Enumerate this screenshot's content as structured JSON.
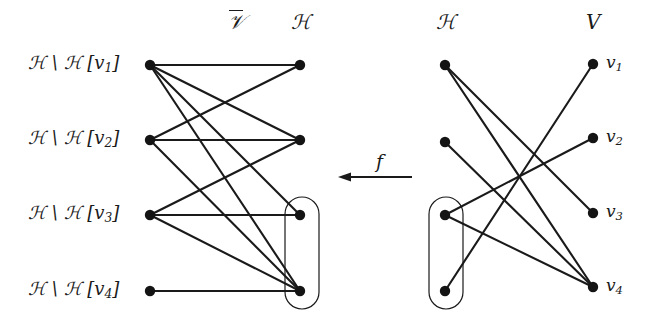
{
  "figure": {
    "background_color": "#ffffff",
    "ink_color": "#1a1a1a",
    "width": 662,
    "height": 325
  },
  "left_graph": {
    "column_headers": {
      "left": "𝒱",
      "left_plain": "V-bar",
      "right": "ℋ"
    },
    "left_nodes": [
      {
        "id": "L1",
        "label_prefix": "ℋ \\ ℋ [v",
        "label_sub": "1",
        "label_suffix": "]",
        "x": 150,
        "y": 65
      },
      {
        "id": "L2",
        "label_prefix": "ℋ \\ ℋ [v",
        "label_sub": "2",
        "label_suffix": "]",
        "x": 150,
        "y": 140
      },
      {
        "id": "L3",
        "label_prefix": "ℋ \\ ℋ [v",
        "label_sub": "3",
        "label_suffix": "]",
        "x": 150,
        "y": 215
      },
      {
        "id": "L4",
        "label_prefix": "ℋ \\ ℋ [v",
        "label_sub": "4",
        "label_suffix": "]",
        "x": 150,
        "y": 291
      }
    ],
    "right_nodes": [
      {
        "id": "R1",
        "x": 300,
        "y": 65
      },
      {
        "id": "R2",
        "x": 300,
        "y": 140
      },
      {
        "id": "R3",
        "x": 300,
        "y": 215
      },
      {
        "id": "R4",
        "x": 300,
        "y": 291
      }
    ],
    "edges": [
      {
        "from": "L1",
        "to": "R1"
      },
      {
        "from": "L1",
        "to": "R2"
      },
      {
        "from": "L1",
        "to": "R3"
      },
      {
        "from": "L1",
        "to": "R4"
      },
      {
        "from": "L2",
        "to": "R1"
      },
      {
        "from": "L2",
        "to": "R2"
      },
      {
        "from": "L2",
        "to": "R4"
      },
      {
        "from": "L3",
        "to": "R2"
      },
      {
        "from": "L3",
        "to": "R3"
      },
      {
        "from": "L3",
        "to": "R4"
      },
      {
        "from": "L4",
        "to": "R4"
      }
    ],
    "grouping_oval": {
      "members": [
        "R3",
        "R4"
      ],
      "x": 285,
      "y": 197,
      "width": 34,
      "height": 112,
      "radius": 17
    }
  },
  "mapping_arrow": {
    "label": "f",
    "direction": "right-to-left",
    "x_start": 412,
    "x_end": 338,
    "y": 177,
    "label_x": 376,
    "label_y": 152
  },
  "right_graph": {
    "column_headers": {
      "left": "ℋ",
      "right": "V"
    },
    "left_nodes": [
      {
        "id": "H1",
        "x": 445,
        "y": 65
      },
      {
        "id": "H2",
        "x": 445,
        "y": 142
      },
      {
        "id": "H3",
        "x": 445,
        "y": 215
      },
      {
        "id": "H4",
        "x": 445,
        "y": 291
      }
    ],
    "right_nodes": [
      {
        "id": "V1",
        "label_prefix": "v",
        "label_sub": "1",
        "x": 593,
        "y": 64
      },
      {
        "id": "V2",
        "label_prefix": "v",
        "label_sub": "2",
        "x": 593,
        "y": 138
      },
      {
        "id": "V3",
        "label_prefix": "v",
        "label_sub": "3",
        "x": 593,
        "y": 213
      },
      {
        "id": "V4",
        "label_prefix": "v",
        "label_sub": "4",
        "x": 593,
        "y": 287
      }
    ],
    "edges": [
      {
        "from": "H1",
        "to": "V3"
      },
      {
        "from": "H1",
        "to": "V4"
      },
      {
        "from": "H2",
        "to": "V4"
      },
      {
        "from": "H3",
        "to": "V2"
      },
      {
        "from": "H3",
        "to": "V4"
      },
      {
        "from": "H4",
        "to": "V1"
      }
    ],
    "grouping_oval": {
      "members": [
        "H3",
        "H4"
      ],
      "x": 429,
      "y": 197,
      "width": 34,
      "height": 112,
      "radius": 17
    }
  },
  "headers": {
    "left_graph_left": "𝒱",
    "left_graph_right": "ℋ",
    "right_graph_left": "ℋ",
    "right_graph_right": "V"
  }
}
